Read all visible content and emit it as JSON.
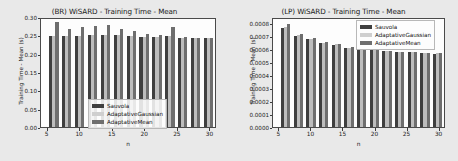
{
  "figure": {
    "background_color": "#e9e9e9",
    "panel_background_color": "#fdfdfd"
  },
  "legend_common": {
    "entries": [
      {
        "label": "Sauvola",
        "color": "#3f3f3f"
      },
      {
        "label": "AdaptativeGaussian",
        "color": "#cfcfcf"
      },
      {
        "label": "AdaptativeMean",
        "color": "#6e6e6e"
      }
    ]
  },
  "chart_data": [
    {
      "type": "bar",
      "id": "br-wisard-training-time-mean",
      "title": "(BR) WiSARD - Training Time - Mean",
      "xlabel": "n",
      "ylabel": "Training Time - Mean (s)",
      "xlim": [
        4,
        31
      ],
      "ylim": [
        0.0,
        0.3
      ],
      "yticks": [
        "0.00",
        "0.05",
        "0.10",
        "0.15",
        "0.20",
        "0.25",
        "0.30"
      ],
      "ytick_values": [
        0.0,
        0.05,
        0.1,
        0.15,
        0.2,
        0.25,
        0.3
      ],
      "xticks": [
        "5",
        "10",
        "15",
        "20",
        "25",
        "30"
      ],
      "xtick_values": [
        5,
        10,
        15,
        20,
        25,
        30
      ],
      "grid": false,
      "legend_position": "lower center",
      "categories": [
        6,
        8,
        10,
        12,
        14,
        16,
        18,
        20,
        22,
        24,
        26,
        28,
        30
      ],
      "series": [
        {
          "name": "Sauvola",
          "color": "#3f3f3f",
          "values": [
            0.253,
            0.253,
            0.253,
            0.255,
            0.255,
            0.255,
            0.252,
            0.251,
            0.25,
            0.252,
            0.248,
            0.246,
            0.246
          ]
        },
        {
          "name": "AdaptativeGaussian",
          "color": "#cfcfcf",
          "values": [
            0.254,
            0.253,
            0.254,
            0.256,
            0.256,
            0.255,
            0.252,
            0.251,
            0.25,
            0.253,
            0.248,
            0.246,
            0.246
          ]
        },
        {
          "name": "AdaptativeMean",
          "color": "#6e6e6e",
          "values": [
            0.291,
            0.272,
            0.278,
            0.281,
            0.283,
            0.272,
            0.266,
            0.258,
            0.256,
            0.279,
            0.249,
            0.247,
            0.247
          ]
        }
      ]
    },
    {
      "type": "bar",
      "id": "lp-wisard-training-time-mean",
      "title": "(LP) WiSARD - Training Time - Mean",
      "xlabel": "n",
      "ylabel": "Training Time - Mean (s)",
      "xlim": [
        4,
        31
      ],
      "ylim": [
        0.0,
        0.00085
      ],
      "yticks": [
        "0.0000",
        "0.0001",
        "0.0002",
        "0.0003",
        "0.0004",
        "0.0005",
        "0.0006",
        "0.0007",
        "0.0008"
      ],
      "ytick_values": [
        0.0,
        0.0001,
        0.0002,
        0.0003,
        0.0004,
        0.0005,
        0.0006,
        0.0007,
        0.0008
      ],
      "xticks": [
        "5",
        "10",
        "15",
        "20",
        "25",
        "30"
      ],
      "xtick_values": [
        5,
        10,
        15,
        20,
        25,
        30
      ],
      "grid": false,
      "legend_position": "upper right",
      "categories": [
        6,
        8,
        10,
        12,
        14,
        16,
        18,
        20,
        22,
        24,
        26,
        28,
        30
      ],
      "series": [
        {
          "name": "Sauvola",
          "color": "#3f3f3f",
          "values": [
            0.000778,
            0.000718,
            0.000694,
            0.000662,
            0.000648,
            0.000622,
            0.000612,
            0.000608,
            0.000596,
            0.000592,
            0.000589,
            0.000583,
            0.000578
          ]
        },
        {
          "name": "AdaptativeGaussian",
          "color": "#cfcfcf",
          "values": [
            0.000789,
            0.000726,
            0.000696,
            0.000664,
            0.00065,
            0.000624,
            0.000613,
            0.000609,
            0.000597,
            0.000593,
            0.00059,
            0.000584,
            0.000579
          ]
        },
        {
          "name": "AdaptativeMean",
          "color": "#6e6e6e",
          "values": [
            0.000808,
            0.000733,
            0.000698,
            0.000668,
            0.000651,
            0.000626,
            0.000614,
            0.00061,
            0.000598,
            0.000594,
            0.000591,
            0.000585,
            0.00058
          ]
        }
      ]
    }
  ]
}
